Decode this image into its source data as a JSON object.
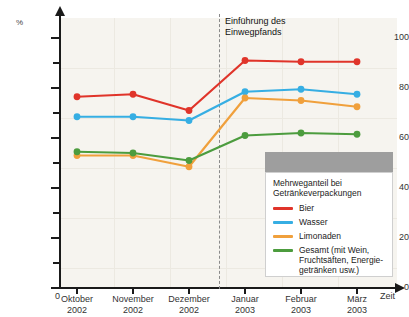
{
  "chart_data": {
    "type": "line",
    "title": "Mehrweganteil bei Getränkeverpackungen",
    "xlabel": "Zeit",
    "ylabel": "%",
    "ylim": [
      0,
      110
    ],
    "yticks": [
      0,
      20,
      40,
      60,
      80,
      100
    ],
    "ytick_labels": [
      "0",
      "20",
      "40",
      "60",
      "80",
      "100"
    ],
    "minor_yticks": [
      10,
      30,
      50,
      70,
      90
    ],
    "grid": true,
    "legend_position": "bottom-right",
    "origin_label": "0",
    "categories": [
      "Oktober\n2002",
      "November\n2002",
      "Dezember\n2002",
      "Januar\n2003",
      "Februar\n2003",
      "März\n2003"
    ],
    "category_lines": [
      [
        "Oktober",
        "2002"
      ],
      [
        "November",
        "2002"
      ],
      [
        "Dezember",
        "2002"
      ],
      [
        "Januar",
        "2003"
      ],
      [
        "Februar",
        "2003"
      ],
      [
        "März",
        "2003"
      ]
    ],
    "series": [
      {
        "name": "Bier",
        "color": "#e0342a",
        "values": [
          76.5,
          77.5,
          71.0,
          91.0,
          90.5,
          90.5
        ]
      },
      {
        "name": "Wasser",
        "color": "#36aee3",
        "values": [
          68.5,
          68.5,
          67.0,
          78.5,
          79.5,
          77.5
        ]
      },
      {
        "name": "Limonaden",
        "color": "#f0a03c",
        "values": [
          53.0,
          53.0,
          48.5,
          76.0,
          75.0,
          72.5
        ]
      },
      {
        "name": "Gesamt (mit Wein,\nFruchtsäften, Energie-\ngetränken usw.)",
        "short_name": "Gesamt",
        "color": "#4c9c3e",
        "values": [
          54.5,
          54.0,
          51.0,
          61.0,
          62.0,
          61.5
        ]
      }
    ],
    "annotations": [
      {
        "text": "Einführung des\nEinwegpfands",
        "between_categories": [
          "Dezember 2002",
          "Januar 2003"
        ],
        "style": "dashed-vertical-line"
      }
    ]
  },
  "legend": {
    "title": "Mehrweganteil bei\nGetränkeverpackungen",
    "entries": [
      {
        "label": "Bier",
        "color": "#e0342a"
      },
      {
        "label": "Wasser",
        "color": "#36aee3"
      },
      {
        "label": "Limonaden",
        "color": "#f0a03c"
      },
      {
        "label": "Gesamt (mit Wein,\nFruchtsäften, Energie-\ngetränken usw.)",
        "color": "#4c9c3e"
      }
    ]
  },
  "axes": {
    "y_unit": "%",
    "x_name": "Zeit",
    "origin": "0"
  },
  "colors": {
    "plot_background": "#f6f4ef",
    "gridline": "#ece9e1",
    "axis": "#1a1a1a",
    "event_line": "#8a8a8a",
    "legend_header_bar": "#9e9e9e",
    "legend_border": "#cfcfcf"
  }
}
